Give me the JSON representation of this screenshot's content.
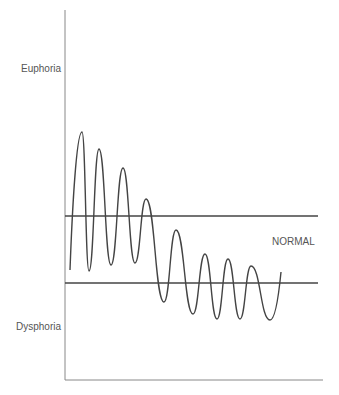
{
  "chart_data": {
    "type": "line",
    "title": "",
    "xlabel": "",
    "ylabel": "",
    "y_tick_labels": [
      "Euphoria",
      "Dysphoria"
    ],
    "annotations": [
      "NORMAL"
    ],
    "grid": false,
    "legend": null,
    "reference_band": {
      "label": "NORMAL",
      "upper_line_y_px": 216,
      "lower_line_y_px": 283,
      "x_start_px": 65,
      "x_end_px": 318
    },
    "series": [
      {
        "name": "mood-oscillation",
        "description": "Damped oscillation starting with large swings into euphoria, gradually settling with swings centered lower toward dysphoria",
        "points_px": [
          [
            70,
            270
          ],
          [
            82,
            132
          ],
          [
            89,
            271
          ],
          [
            99,
            149
          ],
          [
            111,
            265
          ],
          [
            123,
            168
          ],
          [
            135,
            263
          ],
          [
            146,
            199
          ],
          [
            164,
            302
          ],
          [
            176,
            230
          ],
          [
            193,
            314
          ],
          [
            205,
            254
          ],
          [
            217,
            319
          ],
          [
            228,
            259
          ],
          [
            240,
            319
          ],
          [
            251,
            266
          ],
          [
            270,
            320
          ],
          [
            281,
            272
          ]
        ]
      }
    ],
    "axes": {
      "y_axis": {
        "x_px": 65,
        "y_top_px": 10,
        "y_bottom_px": 380
      },
      "x_axis": {
        "y_px": 380,
        "x_left_px": 65,
        "x_right_px": 323
      }
    }
  },
  "labels": {
    "euphoria": "Euphoria",
    "dysphoria": "Dysphoria",
    "normal": "NORMAL"
  },
  "colors": {
    "axis": "#888888",
    "line": "#444444",
    "text": "#555555",
    "background": "#ffffff"
  }
}
